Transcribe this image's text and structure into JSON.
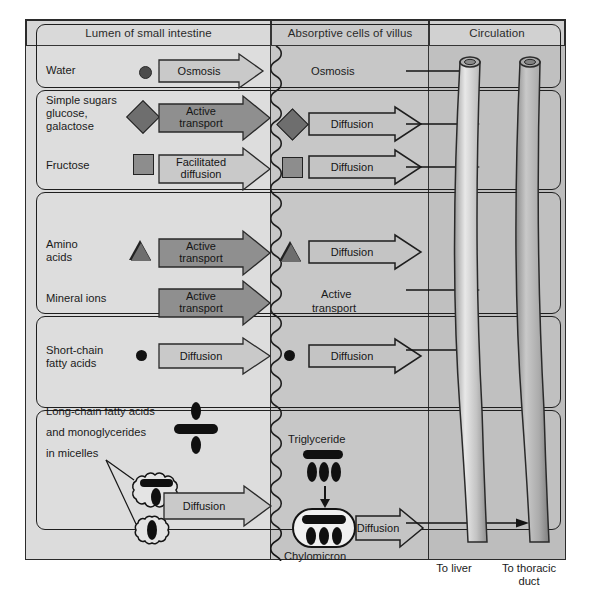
{
  "diagram": {
    "headers": [
      {
        "id": "lumen",
        "label": "Lumen of small intestine"
      },
      {
        "id": "cells",
        "label": "Absorptive cells of villus"
      },
      {
        "id": "circ",
        "label": "Circulation"
      }
    ],
    "colors": {
      "page_background": "#ffffff",
      "frame_border": "#2b2b2b",
      "lumen_panel": "#dcdcdc",
      "cells_panel": "#c4c4c4",
      "circulation_panel": "#bdbdbd",
      "header_band": "#d7d7d7",
      "active_transport_arrow": "#8f8f8f",
      "passive_arrow": "#c9c9c9",
      "open_arrow": "#c4c4c4",
      "molecule_dark": "#101010",
      "molecule_mid": "#6e6e6e",
      "molecule_light": "#8d8d8d",
      "vessel_fill": "#b6b6b6"
    },
    "rows": [
      {
        "id": "water",
        "nutrient": "Water",
        "molecule_icon": "filled-circle-gray",
        "lumen_mechanism": "Osmosis",
        "lumen_mechanism_type": "passive",
        "cell_mechanism": "Osmosis",
        "cell_mechanism_type": "text-only",
        "destination": "blood"
      },
      {
        "id": "simple-sugars",
        "nutrient": "Simple sugars\nglucose,\ngalactose",
        "molecule_icon": "filled-diamond-gray",
        "lumen_mechanism": "Active\ntransport",
        "lumen_mechanism_type": "active",
        "cell_mechanism": "Diffusion",
        "cell_mechanism_type": "open",
        "destination": "blood"
      },
      {
        "id": "fructose",
        "nutrient": "Fructose",
        "molecule_icon": "filled-square-gray",
        "lumen_mechanism": "Facilitated\ndiffusion",
        "lumen_mechanism_type": "passive",
        "cell_mechanism": "Diffusion",
        "cell_mechanism_type": "open",
        "destination": "blood"
      },
      {
        "id": "amino-acids",
        "nutrient": "Amino\nacids",
        "molecule_icon": "filled-triangle-gray",
        "lumen_mechanism": "Active\ntransport",
        "lumen_mechanism_type": "active",
        "cell_mechanism": "Diffusion",
        "cell_mechanism_type": "open",
        "destination": "blood"
      },
      {
        "id": "mineral-ions",
        "nutrient": "Mineral ions",
        "molecule_icon": "none",
        "lumen_mechanism": "Active\ntransport",
        "lumen_mechanism_type": "active",
        "cell_mechanism": "Active\ntransport",
        "cell_mechanism_type": "text-only",
        "destination": "blood"
      },
      {
        "id": "short-chain-fatty-acids",
        "nutrient": "Short-chain\nfatty acids",
        "molecule_icon": "filled-circle-black",
        "lumen_mechanism": "Diffusion",
        "lumen_mechanism_type": "passive",
        "cell_mechanism": "Diffusion",
        "cell_mechanism_type": "open",
        "destination": "blood"
      },
      {
        "id": "long-chain-fatty-acids",
        "nutrient": "Long-chain fatty acids\nand monoglycerides\nin micelles",
        "molecule_icon": "fatty-acid-monoglyceride-cluster",
        "lumen_mechanism": "Diffusion",
        "lumen_mechanism_type": "passive",
        "cell_mechanism": "Diffusion",
        "cell_mechanism_type": "open",
        "destination": "lymph"
      }
    ],
    "lumen_labels": {
      "water": "Water",
      "sugars_line1": "Simple sugars",
      "sugars_line2": "glucose,",
      "sugars_line3": "galactose",
      "fructose": "Fructose",
      "amino_line1": "Amino",
      "amino_line2": "acids",
      "minerals": "Mineral ions",
      "scfa_line1": "Short-chain",
      "scfa_line2": "fatty acids",
      "lcfa_line1": "Long-chain fatty acids",
      "lcfa_line2": "and monoglycerides",
      "lcfa_line3": "in micelles"
    },
    "lumen_arrows": {
      "water": "Osmosis",
      "sugars_l1": "Active",
      "sugars_l2": "transport",
      "fructose_l1": "Facilitated",
      "fructose_l2": "diffusion",
      "amino_l1": "Active",
      "amino_l2": "transport",
      "minerals_l1": "Active",
      "minerals_l2": "transport",
      "scfa": "Diffusion",
      "lcfa": "Diffusion"
    },
    "cell_arrows": {
      "water": "Osmosis",
      "sugars": "Diffusion",
      "fructose": "Diffusion",
      "amino": "Diffusion",
      "minerals_l1": "Active",
      "minerals_l2": "transport",
      "scfa": "Diffusion",
      "chylomicron": "Diffusion"
    },
    "lipid_pathway": {
      "triglyceride_label": "Triglyceride",
      "chylomicron_label": "Chylomicron"
    },
    "circulation": {
      "blood_vessel_label_line1": "To liver",
      "blood_vessel_label_line2": "",
      "lymph_vessel_label_line1": "To thoracic",
      "lymph_vessel_label_line2": "duct"
    }
  }
}
